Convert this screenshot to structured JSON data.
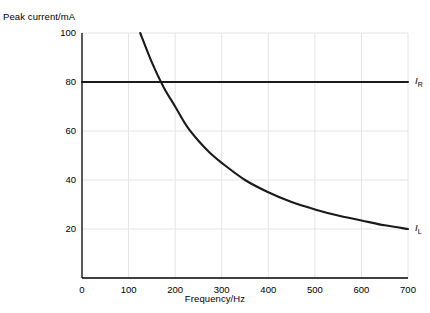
{
  "chart_data": {
    "type": "line",
    "title": "",
    "xlabel": "Frequency/Hz",
    "ylabel": "Peak current/mA",
    "xlim": [
      0,
      700
    ],
    "ylim": [
      0,
      100
    ],
    "grid": true,
    "legend_position": "inline-right",
    "xticks": [
      0,
      100,
      200,
      300,
      400,
      500,
      600,
      700
    ],
    "xtick_labels": [
      "0",
      "100",
      "200",
      "300",
      "400",
      "500",
      "600",
      "700"
    ],
    "yticks": [
      20,
      40,
      60,
      80,
      100
    ],
    "ytick_labels": [
      "20",
      "40",
      "60",
      "80",
      "100"
    ],
    "series": [
      {
        "name": "I_R",
        "label_text": "I",
        "label_sub": "R",
        "color": "#1a1a1a",
        "x": [
          0,
          100,
          200,
          300,
          400,
          500,
          600,
          700
        ],
        "values": [
          80,
          80,
          80,
          80,
          80,
          80,
          80,
          80
        ]
      },
      {
        "name": "I_L",
        "label_text": "I",
        "label_sub": "L",
        "color": "#1a1a1a",
        "x": [
          125,
          150,
          175,
          200,
          225,
          250,
          275,
          300,
          350,
          400,
          450,
          500,
          550,
          600,
          650,
          700
        ],
        "values": [
          100,
          88,
          78,
          70,
          62,
          56,
          51,
          47,
          40,
          35,
          31,
          28,
          25.5,
          23.5,
          21.5,
          20
        ]
      }
    ],
    "colors": {
      "axis": "#000000",
      "grid": "#e4e4e4",
      "curve": "#1a1a1a",
      "background": "#ffffff"
    }
  }
}
